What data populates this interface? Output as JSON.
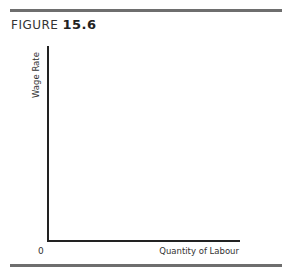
{
  "figure": {
    "label": "FIGURE",
    "number": "15.6"
  },
  "chart_data": {
    "type": "line",
    "xlabel": "Quantity of Labour",
    "ylabel": "Wage Rate",
    "origin_label": "0",
    "series": [],
    "grid": false,
    "legend": null
  }
}
